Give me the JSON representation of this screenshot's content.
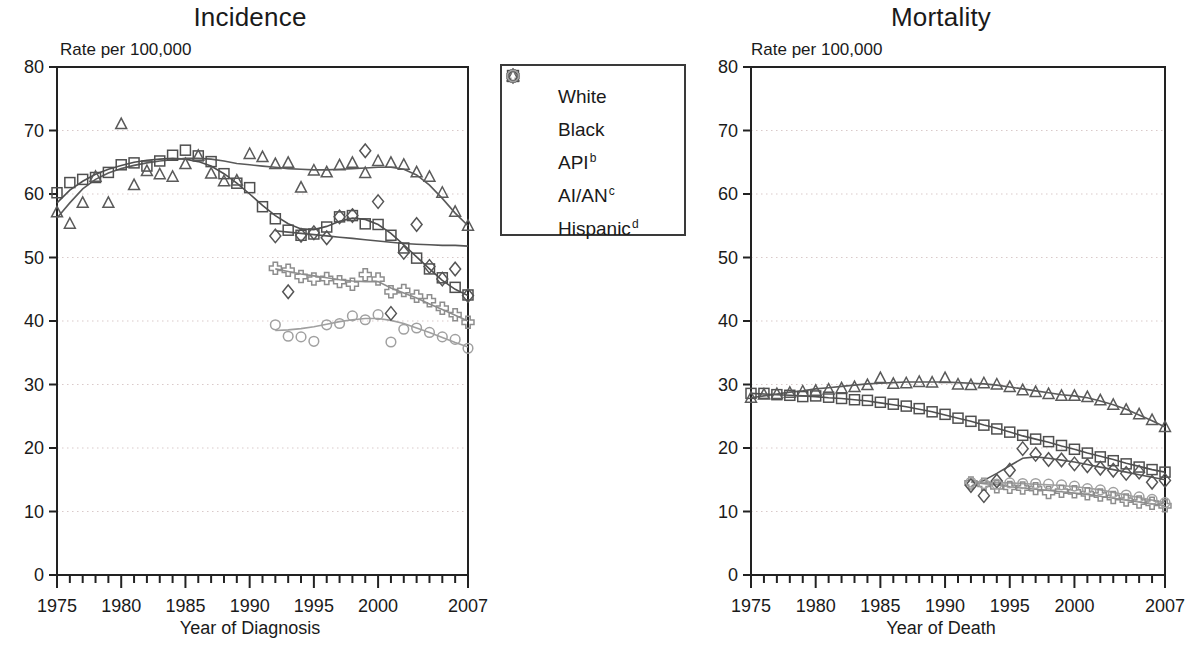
{
  "legend": {
    "items": [
      {
        "label": "White",
        "symbol": "square",
        "color": "#4f4f4f"
      },
      {
        "label": "Black",
        "symbol": "triangle",
        "color": "#5a5a5a"
      },
      {
        "label": "API",
        "sup": "b",
        "symbol": "cross",
        "color": "#8d8d8d"
      },
      {
        "label": "AI/AN",
        "sup": "c",
        "symbol": "diamond",
        "color": "#555555"
      },
      {
        "label": "Hispanic",
        "sup": "d",
        "symbol": "circle",
        "color": "#a0a0a0"
      }
    ]
  },
  "incidence": {
    "title": "Incidence",
    "y_axis_note": "Rate per 100,000",
    "x_axis_label": "Year of Diagnosis"
  },
  "mortality": {
    "title": "Mortality",
    "y_axis_note": "Rate per 100,000",
    "x_axis_label": "Year of Death"
  },
  "chart_data": [
    {
      "type": "scatter",
      "title": "Incidence",
      "xlabel": "Year of Diagnosis",
      "ylabel": "Rate per 100,000",
      "xlim": [
        1975,
        2007
      ],
      "ylim": [
        0,
        80
      ],
      "ytick_labels": [
        "0",
        "10",
        "20",
        "30",
        "40",
        "50",
        "60",
        "70",
        "80"
      ],
      "yticks": [
        0,
        10,
        20,
        30,
        40,
        50,
        60,
        70,
        80
      ],
      "xtick_labels": [
        "1975",
        "1980",
        "1985",
        "1990",
        "1995",
        "2000",
        "2007"
      ],
      "xticks": [
        1975,
        1980,
        1985,
        1990,
        1995,
        2000,
        2007
      ],
      "grid": "horizontal-dotted",
      "legend_position": "center-outside",
      "series": [
        {
          "name": "White",
          "symbol": "square",
          "color": "#4f4f4f",
          "x": [
            1975,
            1976,
            1977,
            1978,
            1979,
            1980,
            1981,
            1982,
            1983,
            1984,
            1985,
            1986,
            1987,
            1988,
            1989,
            1990,
            1991,
            1992,
            1993,
            1994,
            1995,
            1996,
            1997,
            1998,
            1999,
            2000,
            2001,
            2002,
            2003,
            2004,
            2005,
            2006,
            2007
          ],
          "y": [
            60.2,
            61.8,
            62.3,
            62.6,
            63.4,
            64.6,
            64.9,
            64.4,
            65.2,
            66.1,
            66.9,
            66.0,
            65.1,
            63.2,
            61.7,
            61.0,
            58.0,
            56.1,
            54.3,
            53.5,
            53.7,
            54.8,
            56.4,
            56.6,
            55.3,
            55.2,
            53.5,
            51.5,
            49.9,
            48.2,
            46.8,
            45.3,
            44.1
          ],
          "trend_y": [
            58.6,
            60.6,
            62.0,
            63.1,
            63.9,
            64.5,
            65.0,
            65.3,
            65.5,
            65.6,
            65.5,
            65.1,
            64.4,
            63.2,
            61.7,
            60.0,
            58.2,
            56.6,
            55.3,
            54.5,
            54.4,
            54.9,
            55.7,
            56.2,
            56.0,
            55.2,
            53.8,
            52.0,
            50.1,
            48.2,
            46.4,
            45.0,
            44.0
          ]
        },
        {
          "name": "Black",
          "symbol": "triangle",
          "color": "#5a5a5a",
          "x": [
            1975,
            1976,
            1977,
            1978,
            1979,
            1980,
            1981,
            1982,
            1983,
            1984,
            1985,
            1986,
            1987,
            1988,
            1989,
            1990,
            1991,
            1992,
            1993,
            1994,
            1995,
            1996,
            1997,
            1998,
            1999,
            2000,
            2001,
            2002,
            2003,
            2004,
            2005,
            2006,
            2007
          ],
          "y": [
            57.1,
            55.3,
            58.6,
            62.7,
            58.6,
            71.0,
            61.4,
            63.6,
            63.1,
            62.7,
            64.7,
            66.0,
            63.2,
            62.0,
            62.1,
            66.3,
            65.8,
            64.7,
            64.9,
            61.0,
            63.7,
            63.4,
            64.5,
            64.9,
            63.3,
            65.2,
            64.9,
            64.6,
            63.4,
            62.7,
            60.2,
            57.2,
            55.0
          ],
          "trend_y": [
            56.2,
            58.6,
            60.8,
            62.3,
            63.3,
            64.0,
            64.5,
            64.9,
            65.2,
            65.4,
            65.6,
            65.6,
            65.5,
            65.2,
            64.8,
            64.6,
            64.4,
            64.2,
            64.0,
            63.9,
            63.8,
            63.8,
            63.9,
            64.0,
            64.1,
            64.2,
            64.2,
            63.9,
            63.0,
            61.4,
            59.3,
            57.0,
            55.0
          ]
        },
        {
          "name": "API",
          "symbol": "cross",
          "color": "#8d8d8d",
          "x": [
            1992,
            1993,
            1994,
            1995,
            1996,
            1997,
            1998,
            1999,
            2000,
            2001,
            2002,
            2003,
            2004,
            2005,
            2006,
            2007
          ],
          "y": [
            48.3,
            48.0,
            47.0,
            46.6,
            46.7,
            46.2,
            45.8,
            47.3,
            46.6,
            44.6,
            44.8,
            43.9,
            43.2,
            42.0,
            41.0,
            39.8
          ],
          "trend_y": [
            48.2,
            47.8,
            47.4,
            47.1,
            46.8,
            46.5,
            46.3,
            46.2,
            46.2,
            45.2,
            44.4,
            43.6,
            42.7,
            41.8,
            40.9,
            40.0
          ]
        },
        {
          "name": "AI/AN",
          "symbol": "diamond",
          "color": "#555555",
          "x": [
            1992,
            1993,
            1994,
            1995,
            1996,
            1997,
            1998,
            1999,
            2000,
            2001,
            2002,
            2003,
            2004,
            2005,
            2006,
            2007
          ],
          "y": [
            53.4,
            44.6,
            53.5,
            53.9,
            53.1,
            56.4,
            56.6,
            66.8,
            58.8,
            41.2,
            50.8,
            55.2,
            48.6,
            46.6,
            48.2,
            44.0
          ],
          "trend_y": [
            54.2,
            54.0,
            53.8,
            53.6,
            53.4,
            53.2,
            53.0,
            52.8,
            52.6,
            52.4,
            52.2,
            52.1,
            52.0,
            51.9,
            51.9,
            51.8
          ]
        },
        {
          "name": "Hispanic",
          "symbol": "circle",
          "color": "#a0a0a0",
          "x": [
            1992,
            1993,
            1994,
            1995,
            1996,
            1997,
            1998,
            1999,
            2000,
            2001,
            2002,
            2003,
            2004,
            2005,
            2006,
            2007
          ],
          "y": [
            39.4,
            37.6,
            37.5,
            36.8,
            39.4,
            39.6,
            40.8,
            40.2,
            41.0,
            36.7,
            38.7,
            38.9,
            38.2,
            37.5,
            37.1,
            35.7
          ],
          "trend_y": [
            38.5,
            38.6,
            38.8,
            39.1,
            39.5,
            39.9,
            40.2,
            40.4,
            40.4,
            40.1,
            39.6,
            38.9,
            38.2,
            37.4,
            36.6,
            35.9
          ]
        }
      ]
    },
    {
      "type": "scatter",
      "title": "Mortality",
      "xlabel": "Year of Death",
      "ylabel": "Rate per 100,000",
      "xlim": [
        1975,
        2007
      ],
      "ylim": [
        0,
        80
      ],
      "ytick_labels": [
        "0",
        "10",
        "20",
        "30",
        "40",
        "50",
        "60",
        "70",
        "80"
      ],
      "yticks": [
        0,
        10,
        20,
        30,
        40,
        50,
        60,
        70,
        80
      ],
      "xtick_labels": [
        "1975",
        "1980",
        "1985",
        "1990",
        "1995",
        "2000",
        "2007"
      ],
      "xticks": [
        1975,
        1980,
        1985,
        1990,
        1995,
        2000,
        2007
      ],
      "grid": "horizontal-dotted",
      "legend_position": "center-outside",
      "series": [
        {
          "name": "White",
          "symbol": "square",
          "color": "#4f4f4f",
          "x": [
            1975,
            1976,
            1977,
            1978,
            1979,
            1980,
            1981,
            1982,
            1983,
            1984,
            1985,
            1986,
            1987,
            1988,
            1989,
            1990,
            1991,
            1992,
            1993,
            1994,
            1995,
            1996,
            1997,
            1998,
            1999,
            2000,
            2001,
            2002,
            2003,
            2004,
            2005,
            2006,
            2007
          ],
          "y": [
            28.6,
            28.6,
            28.4,
            28.3,
            28.1,
            28.2,
            28.0,
            27.8,
            27.6,
            27.5,
            27.2,
            26.9,
            26.6,
            26.2,
            25.7,
            25.3,
            24.7,
            24.2,
            23.6,
            23.0,
            22.5,
            22.0,
            21.4,
            21.0,
            20.4,
            19.8,
            19.2,
            18.6,
            18.0,
            17.5,
            17.0,
            16.6,
            16.2
          ],
          "trend_y": [
            28.6,
            28.5,
            28.4,
            28.3,
            28.2,
            28.1,
            27.9,
            27.8,
            27.6,
            27.4,
            27.1,
            26.8,
            26.5,
            26.1,
            25.7,
            25.2,
            24.7,
            24.2,
            23.6,
            23.1,
            22.5,
            21.9,
            21.4,
            20.9,
            20.3,
            19.8,
            19.2,
            18.7,
            18.2,
            17.6,
            17.1,
            16.6,
            16.2
          ]
        },
        {
          "name": "Black",
          "symbol": "triangle",
          "color": "#5a5a5a",
          "x": [
            1975,
            1976,
            1977,
            1978,
            1979,
            1980,
            1981,
            1982,
            1983,
            1984,
            1985,
            1986,
            1987,
            1988,
            1989,
            1990,
            1991,
            1992,
            1993,
            1994,
            1995,
            1996,
            1997,
            1998,
            1999,
            2000,
            2001,
            2002,
            2003,
            2004,
            2005,
            2006,
            2007
          ],
          "y": [
            27.9,
            28.4,
            28.5,
            28.7,
            28.9,
            29.0,
            29.2,
            29.4,
            29.6,
            29.9,
            31.0,
            30.1,
            30.2,
            30.4,
            30.3,
            31.0,
            30.0,
            29.9,
            30.2,
            30.0,
            29.6,
            29.1,
            28.8,
            28.5,
            28.2,
            28.2,
            28.0,
            27.5,
            26.8,
            26.0,
            25.3,
            24.4,
            23.3
          ],
          "trend_y": [
            27.9,
            28.2,
            28.5,
            28.8,
            29.0,
            29.3,
            29.5,
            29.7,
            29.9,
            30.1,
            30.2,
            30.3,
            30.4,
            30.4,
            30.4,
            30.4,
            30.3,
            30.2,
            30.1,
            29.9,
            29.6,
            29.3,
            29.0,
            28.7,
            28.4,
            28.2,
            27.9,
            27.4,
            26.8,
            26.1,
            25.2,
            24.3,
            23.3
          ]
        },
        {
          "name": "API",
          "symbol": "cross",
          "color": "#8d8d8d",
          "x": [
            1992,
            1993,
            1994,
            1995,
            1996,
            1997,
            1998,
            1999,
            2000,
            2001,
            2002,
            2003,
            2004,
            2005,
            2006,
            2007
          ],
          "y": [
            14.5,
            14.3,
            13.9,
            13.8,
            13.7,
            13.6,
            13.0,
            13.2,
            13.1,
            12.8,
            12.6,
            12.2,
            11.8,
            11.5,
            11.3,
            10.9
          ],
          "trend_y": [
            14.6,
            14.4,
            14.2,
            13.9,
            13.7,
            13.5,
            13.3,
            13.1,
            12.9,
            12.7,
            12.4,
            12.1,
            11.8,
            11.5,
            11.2,
            10.9
          ]
        },
        {
          "name": "AI/AN",
          "symbol": "diamond",
          "color": "#555555",
          "x": [
            1992,
            1993,
            1994,
            1995,
            1996,
            1997,
            1998,
            1999,
            2000,
            2001,
            2002,
            2003,
            2004,
            2005,
            2006,
            2007
          ],
          "y": [
            14.1,
            12.5,
            14.8,
            16.5,
            19.9,
            19.0,
            18.2,
            18.1,
            17.5,
            17.2,
            16.8,
            16.5,
            16.0,
            16.2,
            14.6,
            14.9
          ],
          "trend_y": [
            13.9,
            14.9,
            16.0,
            17.2,
            18.4,
            18.6,
            18.4,
            18.1,
            17.8,
            17.4,
            17.0,
            16.6,
            16.2,
            15.8,
            15.4,
            15.0
          ]
        },
        {
          "name": "Hispanic",
          "symbol": "circle",
          "color": "#a0a0a0",
          "x": [
            1992,
            1993,
            1994,
            1995,
            1996,
            1997,
            1998,
            1999,
            2000,
            2001,
            2002,
            2003,
            2004,
            2005,
            2006,
            2007
          ],
          "y": [
            14.6,
            14.4,
            14.3,
            14.5,
            14.4,
            14.4,
            14.3,
            14.2,
            14.0,
            13.6,
            13.4,
            13.0,
            12.6,
            12.3,
            11.9,
            11.4
          ],
          "trend_y": [
            14.7,
            14.6,
            14.5,
            14.5,
            14.4,
            14.3,
            14.2,
            14.1,
            13.9,
            13.7,
            13.4,
            13.0,
            12.6,
            12.2,
            11.8,
            11.4
          ]
        }
      ]
    }
  ]
}
